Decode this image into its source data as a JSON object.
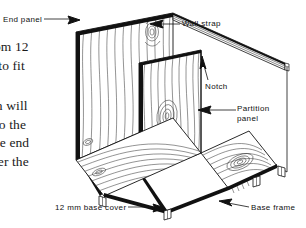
{
  "figure": {
    "kind": "isometric-line-drawing",
    "background_color": "#ffffff",
    "ink_color": "#111111",
    "grain_color": "#333333"
  },
  "body_text": {
    "lines": [
      "om 12",
      "t to fit",
      "th will",
      "to the",
      "ne end",
      "ver the"
    ]
  },
  "callouts": {
    "end_panel": "End  panel",
    "wall_strap": "Wall  strap",
    "notch": "Notch",
    "partition_panel_line1": "Partition",
    "partition_panel_line2": "panel",
    "base_cover": "12 mm  base  cover",
    "base_frame": "Base  frame"
  }
}
